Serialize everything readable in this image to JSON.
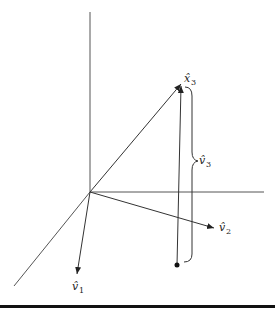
{
  "diagram": {
    "title": "",
    "labels": {
      "x3": {
        "base": "x̂",
        "sub": "3"
      },
      "v1": {
        "base": "v̂",
        "sub": "1"
      },
      "v2": {
        "base": "v̂",
        "sub": "2"
      },
      "v3": {
        "base": "v̂",
        "sub": "3"
      }
    },
    "elements": [
      "vertical axis",
      "horizontal axis",
      "diagonal axis",
      "vector to x3",
      "vector v1",
      "vector v2",
      "vertical segment from point to x3",
      "curly brace labeled v3",
      "point"
    ],
    "colors": {
      "line": "#555555",
      "arrow": "#222222",
      "rule": "#111111"
    }
  }
}
